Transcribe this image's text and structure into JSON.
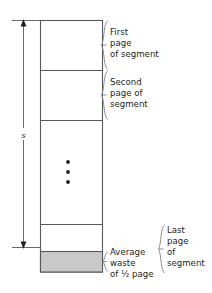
{
  "figure": {
    "dimension_label": "s",
    "dimension_label_name": "segment-size-label",
    "annotations": [
      {
        "id": "first-page",
        "lines": [
          "First",
          "page",
          "of segment"
        ]
      },
      {
        "id": "second-page",
        "lines": [
          "Second",
          "page of",
          "segment"
        ]
      },
      {
        "id": "average-waste",
        "lines": [
          "Average",
          "waste",
          "of ½ page"
        ]
      },
      {
        "id": "last-page",
        "lines": [
          "Last",
          "page",
          "of",
          "segment"
        ]
      }
    ],
    "ellipsis_symbol": "⋮",
    "colors": {
      "outline": "#58595b",
      "brace": "#808285",
      "waste_fill": "#c9c9c9",
      "text": "#231f20",
      "background": "#ffffff"
    },
    "geometry": {
      "segment_top": 20,
      "segment_bottom": 272,
      "waste_top": 251,
      "page_dividers": [
        70,
        120,
        224
      ]
    }
  }
}
